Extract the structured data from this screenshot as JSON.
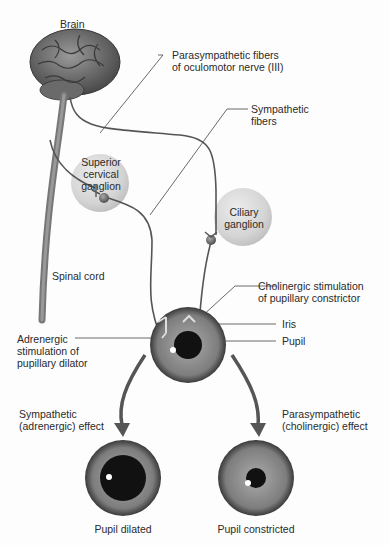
{
  "labels": {
    "brain": "Brain",
    "parasympathetic_fibers_l1": "Parasympathetic fibers",
    "parasympathetic_fibers_l2": "of oculomotor nerve (III)",
    "sympathetic_fibers_l1": "Sympathetic",
    "sympathetic_fibers_l2": "fibers",
    "superior_cervical_l1": "Superior",
    "superior_cervical_l2": "cervical",
    "superior_cervical_l3": "ganglion",
    "ciliary_l1": "Ciliary",
    "ciliary_l2": "ganglion",
    "spinal_cord": "Spinal cord",
    "cholinergic_l1": "Cholinergic stimulation",
    "cholinergic_l2": "of pupillary constrictor",
    "iris": "Iris",
    "pupil": "Pupil",
    "adrenergic_l1": "Adrenergic",
    "adrenergic_l2": "stimulation of",
    "adrenergic_l3": "pupillary dilator",
    "symp_effect_l1": "Sympathetic",
    "symp_effect_l2": "(adrenergic) effect",
    "para_effect_l1": "Parasympathetic",
    "para_effect_l2": "(cholinergic) effect",
    "pupil_dilated": "Pupil dilated",
    "pupil_constricted": "Pupil constricted"
  },
  "colors": {
    "nerve": "#555555",
    "arrow": "#555555",
    "ganglion": "#d6d6d6",
    "iris": "#7a7a7a",
    "pupil": "#111111"
  }
}
